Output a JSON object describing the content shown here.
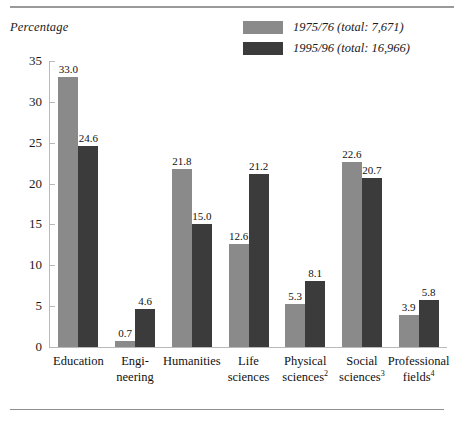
{
  "axis_title": "Percentage",
  "legend": {
    "items": [
      {
        "label": "1975/76 (total:  7,671)",
        "color": "#8a8a8a"
      },
      {
        "label": "1995/96 (total:  16,966)",
        "color": "#3b3b3b"
      }
    ]
  },
  "chart_data": {
    "type": "bar",
    "title": "",
    "xlabel": "",
    "ylabel": "Percentage",
    "ylim": [
      0,
      35
    ],
    "yticks": [
      0,
      5,
      10,
      15,
      20,
      25,
      30,
      35
    ],
    "ytick_labels": [
      "0",
      "5",
      "10",
      "15",
      "20",
      "25",
      "30",
      "35"
    ],
    "grid": false,
    "legend_position": "top-right",
    "categories": [
      "Education",
      "Engi-\nneering",
      "Humanities",
      "Life\nsciences",
      "Physical\nsciences2",
      "Social\nsciences3",
      "Professional\nfields4"
    ],
    "category_lines": [
      [
        "Education"
      ],
      [
        "Engi-",
        "neering"
      ],
      [
        "Humanities"
      ],
      [
        "Life",
        "sciences"
      ],
      [
        "Physical",
        "sciences",
        "2"
      ],
      [
        "Social",
        "sciences",
        "3"
      ],
      [
        "Professional",
        "fields",
        "4"
      ]
    ],
    "series": [
      {
        "name": "1975/76 (total:  7,671)",
        "color": "#8a8a8a",
        "values": [
          33.0,
          0.7,
          21.8,
          12.6,
          5.3,
          22.6,
          3.9
        ],
        "labels": [
          "33.0",
          "0.7",
          "21.8",
          "12.6",
          "5.3",
          "22.6",
          "3.9"
        ]
      },
      {
        "name": "1995/96 (total:  16,966)",
        "color": "#3b3b3b",
        "values": [
          24.6,
          4.6,
          15.0,
          21.2,
          8.1,
          20.7,
          5.8
        ],
        "labels": [
          "24.6",
          "4.6",
          "15.0",
          "21.2",
          "8.1",
          "20.7",
          "5.8"
        ]
      }
    ]
  }
}
